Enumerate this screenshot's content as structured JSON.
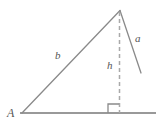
{
  "figure": {
    "background_color": "#ffffff",
    "stroke_color": "#808080",
    "label_color": "#555555",
    "labels": {
      "side_a": "a",
      "side_b": "b",
      "altitude_h": "h",
      "vertex_A": "A"
    },
    "geometry": {
      "vertex_A": [
        22,
        113
      ],
      "apex": [
        120,
        10
      ],
      "side_a_end": [
        141,
        73
      ],
      "foot_of_altitude": [
        119.5,
        113
      ],
      "baseline_start": [
        20,
        113
      ],
      "baseline_end": [
        156,
        113
      ],
      "right_angle_marker": {
        "x": 108,
        "y": 104,
        "size": 11
      },
      "altitude_dashed": true,
      "altitude_dash_pattern": "4 3"
    }
  }
}
